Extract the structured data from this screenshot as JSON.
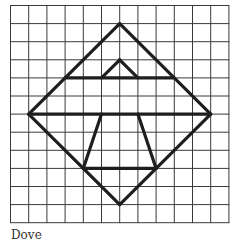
{
  "diagram": {
    "caption": "Dove",
    "grid": {
      "cols": 12,
      "rows": 12,
      "origin_x": 10.5,
      "origin_y": 5.5,
      "cell_w": 18.2,
      "cell_h": 18.1,
      "line_color": "#3a3a3a",
      "line_width": 1
    },
    "shape": {
      "stroke_color": "#1e1e1e",
      "stroke_width": 3.2,
      "segments": [
        {
          "name": "diamond-top-left",
          "from": [
            6,
            1
          ],
          "to": [
            1,
            6
          ]
        },
        {
          "name": "diamond-top-right",
          "from": [
            6,
            1
          ],
          "to": [
            11,
            6
          ]
        },
        {
          "name": "diamond-bottom-left",
          "from": [
            1,
            6
          ],
          "to": [
            6,
            11
          ]
        },
        {
          "name": "diamond-bottom-right",
          "from": [
            11,
            6
          ],
          "to": [
            6,
            11
          ]
        },
        {
          "name": "upper-horizontal",
          "from": [
            3,
            4
          ],
          "to": [
            9,
            4
          ]
        },
        {
          "name": "middle-horizontal",
          "from": [
            1,
            6
          ],
          "to": [
            11,
            6
          ]
        },
        {
          "name": "small-triangle-left",
          "from": [
            5,
            4
          ],
          "to": [
            6,
            3
          ]
        },
        {
          "name": "small-triangle-right",
          "from": [
            6,
            3
          ],
          "to": [
            7,
            4
          ]
        },
        {
          "name": "trapezoid-left",
          "from": [
            5,
            6
          ],
          "to": [
            4,
            9
          ]
        },
        {
          "name": "trapezoid-right",
          "from": [
            7,
            6
          ],
          "to": [
            8,
            9
          ]
        },
        {
          "name": "trapezoid-bottom",
          "from": [
            4,
            9
          ],
          "to": [
            8,
            9
          ]
        }
      ]
    }
  }
}
